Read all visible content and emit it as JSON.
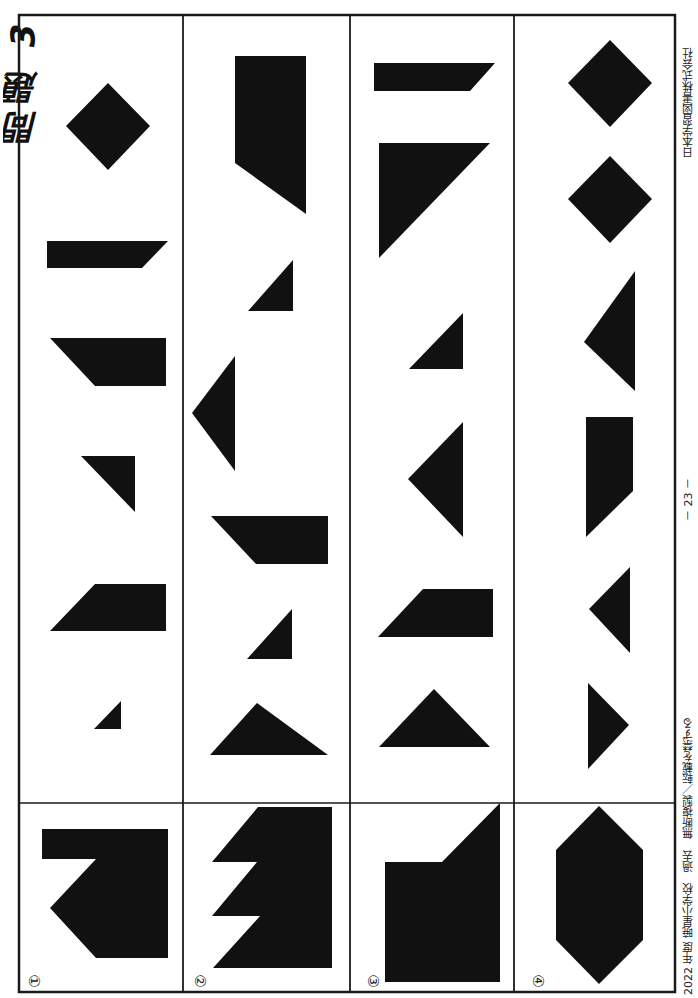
{
  "page": {
    "title": "問題 3 8",
    "publisher": "日本学習図書株式会社",
    "page_number": "－ 23 －",
    "copyright": "2022 年度 暁星小学校　過去　無断複製／転載を禁ずる"
  },
  "colors": {
    "ink": "#111111",
    "paper": "#ffffff",
    "frame": "#1a1a1a"
  },
  "frame": {
    "left": 19,
    "right": 675,
    "top": 15,
    "bottom": 992,
    "column_dividers": [
      183,
      350,
      514
    ],
    "row_divider": 803
  },
  "problems": [
    {
      "label": "①",
      "label_pos": [
        34,
        981
      ],
      "target": "42,829 168,829 168,958 96,958 50,908 96,859 42,859",
      "pieces": [
        "108,83 150,126 108,170 66,126",
        "47,241 168,241 142,268 47,268",
        "50,338 166,338 166,386 95,386",
        "81,456 135,456 135,512",
        "50,631 95,584 166,584 166,631",
        "94,729 121,701 121,729"
      ]
    },
    {
      "label": "②",
      "label_pos": [
        200,
        981
      ],
      "target": "258,807 332,807 332,968 213,968 260,916 212,916 257,862 212,862",
      "pieces": [
        "235,56 306,56 306,214 235,163",
        "293,260 293,311 248,311",
        "235,356 192,413 235,471",
        "211,516 328,516 328,564 256,564",
        "292,609 292,659 247,659",
        "257,703 328,755 210,755"
      ]
    },
    {
      "label": "③",
      "label_pos": [
        373,
        981
      ],
      "target": "385,862 442,862 500,803 500,982 385,982",
      "pieces": [
        "374,63 495,63 470,91 374,91",
        "379,143 490,143 379,258",
        "463,313 463,369 409,369",
        "463,422 408,479 463,537",
        "378,637 423,589 493,589 493,637",
        "434,689 490,747 379,747"
      ]
    },
    {
      "label": "④",
      "label_pos": [
        538,
        981
      ],
      "target": "599,806 643,850 643,940 599,984 556,940 556,850",
      "pieces": [
        "610,40 652,83 610,127 568,83",
        "610,156 652,199 610,243 568,199",
        "635,271 635,391 584,342",
        "586,417 633,417 633,491 586,537",
        "630,567 630,653 589,609",
        "588,683 629,725 588,769"
      ]
    }
  ]
}
